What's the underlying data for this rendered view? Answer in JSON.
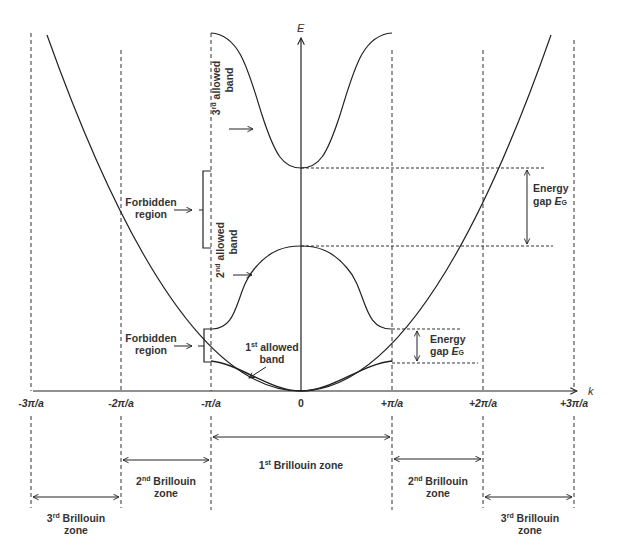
{
  "diagram": {
    "axes": {
      "x_label": "k",
      "y_label": "E",
      "ticks": [
        "-3π/a",
        "-2π/a",
        "-π/a",
        "0",
        "+π/a",
        "+2π/a",
        "+3π/a"
      ]
    },
    "bands": {
      "third": {
        "ordinal": "3",
        "sup": "rd",
        "line1": "allowed",
        "line2": "band"
      },
      "second": {
        "ordinal": "2",
        "sup": "nd",
        "line1": "allowed",
        "line2": "band"
      },
      "first": {
        "ordinal": "1",
        "sup": "st",
        "line1": "allowed",
        "line2": "band"
      }
    },
    "forbidden_regions": [
      {
        "line1": "Forbidden",
        "line2": "region"
      },
      {
        "line1": "Forbidden",
        "line2": "region"
      }
    ],
    "energy_gaps": [
      {
        "line1": "Energy",
        "line2": "gap",
        "symbol": "E",
        "subscript": "G"
      },
      {
        "line1": "Energy",
        "line2": "gap",
        "symbol": "E",
        "subscript": "G"
      }
    ],
    "brillouin_zones": {
      "first": {
        "ordinal": "1",
        "sup": "st",
        "text": "Brillouin zone"
      },
      "second_left": {
        "ordinal": "2",
        "sup": "nd",
        "line1": "Brillouin",
        "line2": "zone"
      },
      "second_right": {
        "ordinal": "2",
        "sup": "nd",
        "line1": "Brillouin",
        "line2": "zone"
      },
      "third_left": {
        "ordinal": "3",
        "sup": "rd",
        "line1": "Brillouin",
        "line2": "zone"
      },
      "third_right": {
        "ordinal": "3",
        "sup": "rd",
        "line1": "Brillouin",
        "line2": "zone"
      }
    },
    "colors": {
      "line": "#222222",
      "text": "#333333",
      "background": "#ffffff"
    }
  }
}
